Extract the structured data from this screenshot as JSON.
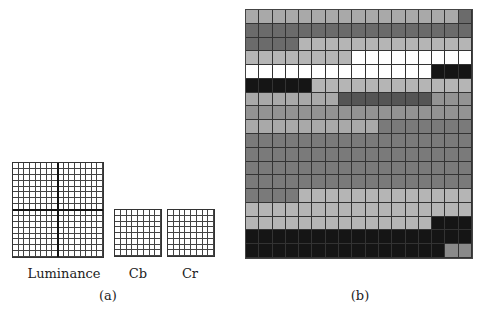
{
  "panel_a": {
    "caption": "(a)",
    "luminance": {
      "label": "Luminance",
      "cols": 16,
      "rows": 16
    },
    "cb": {
      "label": "Cb",
      "cols": 8,
      "rows": 8
    },
    "cr": {
      "label": "Cr",
      "cols": 8,
      "rows": 8
    }
  },
  "panel_b": {
    "caption": "(b)",
    "cols": 17,
    "rows": 18,
    "palette": {
      "L": "#a9a9a9",
      "LL": "#b5b5b5",
      "D": "#6b6b6b",
      "DD": "#555555",
      "G": "#7a7a7a",
      "M": "#939393",
      "W": "#ffffff",
      "K": "#151515",
      "S": "#8a8a8a"
    },
    "row_runs": [
      [
        [
          "L",
          16
        ],
        [
          "D",
          1
        ]
      ],
      [
        [
          "D",
          17
        ]
      ],
      [
        [
          "D",
          4
        ],
        [
          "LL",
          13
        ]
      ],
      [
        [
          "LL",
          8
        ],
        [
          "W",
          9
        ]
      ],
      [
        [
          "W",
          14
        ],
        [
          "K",
          3
        ]
      ],
      [
        [
          "K",
          5
        ],
        [
          "LL",
          12
        ]
      ],
      [
        [
          "L",
          7
        ],
        [
          "DD",
          7
        ],
        [
          "M",
          3
        ]
      ],
      [
        [
          "M",
          17
        ]
      ],
      [
        [
          "L",
          10
        ],
        [
          "G",
          7
        ]
      ],
      [
        [
          "G",
          17
        ]
      ],
      [
        [
          "G",
          17
        ]
      ],
      [
        [
          "G",
          17
        ]
      ],
      [
        [
          "G",
          17
        ]
      ],
      [
        [
          "G",
          4
        ],
        [
          "LL",
          13
        ]
      ],
      [
        [
          "LL",
          17
        ]
      ],
      [
        [
          "LL",
          14
        ],
        [
          "K",
          3
        ]
      ],
      [
        [
          "K",
          17
        ]
      ],
      [
        [
          "K",
          15
        ],
        [
          "S",
          2
        ]
      ]
    ]
  }
}
